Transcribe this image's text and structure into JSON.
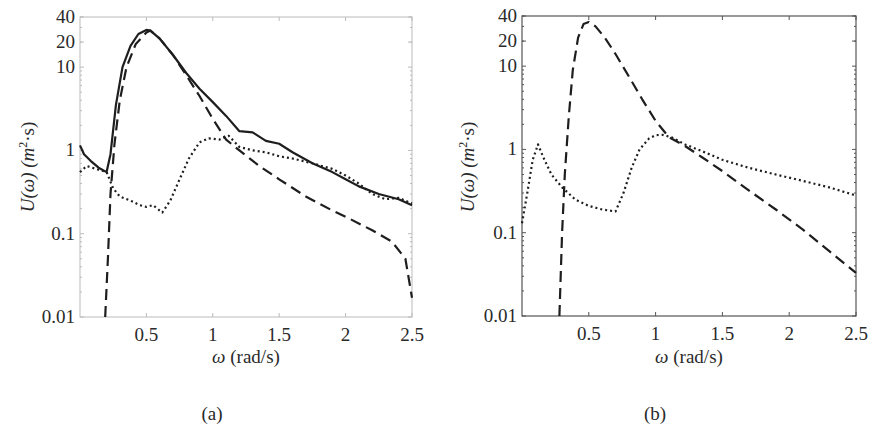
{
  "figure": {
    "panels": [
      {
        "id": "a",
        "caption": "(a)",
        "ylabel_main": "U(ω) (m",
        "ylabel_sup": "2",
        "ylabel_tail": "·s)",
        "xlabel_omega": "ω",
        "xlabel_unit": "(rad/s)",
        "y_tick_labels": [
          "40",
          "20",
          "10",
          "1",
          "0.1",
          "0.01"
        ],
        "x_tick_labels": [
          "0.5",
          "1",
          "1.5",
          "2",
          "2.5"
        ]
      },
      {
        "id": "b",
        "caption": "(b)",
        "ylabel_main": "U(ω) (m",
        "ylabel_sup": "2",
        "ylabel_tail": "·s)",
        "xlabel_omega": "ω",
        "xlabel_unit": "(rad/s)",
        "y_tick_labels": [
          "40",
          "20",
          "10",
          "1",
          "0.1",
          "0.01"
        ],
        "x_tick_labels": [
          "0.5",
          "1",
          "1.5",
          "2",
          "2.5"
        ]
      }
    ]
  },
  "chart_data": [
    {
      "type": "line",
      "panel": "(a)",
      "title": "",
      "xlabel": "ω (rad/s)",
      "ylabel": "U(ω) (m²·s)",
      "xlim": [
        0,
        2.5
      ],
      "ylim": [
        0.01,
        40
      ],
      "yscale": "log",
      "x_ticks": [
        0.5,
        1,
        1.5,
        2,
        2.5
      ],
      "y_ticks": [
        0.01,
        0.1,
        1,
        10,
        20,
        40
      ],
      "grid": false,
      "legend": "none",
      "series": [
        {
          "name": "solid",
          "style": "solid",
          "x": [
            0.0,
            0.03,
            0.08,
            0.14,
            0.2,
            0.23,
            0.27,
            0.32,
            0.38,
            0.44,
            0.5,
            0.53,
            0.6,
            0.7,
            0.8,
            0.9,
            1.0,
            1.1,
            1.2,
            1.3,
            1.4,
            1.5,
            1.6,
            1.75,
            1.9,
            2.0,
            2.1,
            2.25,
            2.4,
            2.5
          ],
          "values": [
            1.15,
            0.9,
            0.75,
            0.62,
            0.55,
            0.9,
            3.5,
            10,
            18,
            25,
            28,
            27.5,
            22,
            14,
            8.5,
            5.5,
            3.8,
            2.6,
            1.7,
            1.65,
            1.3,
            1.2,
            0.95,
            0.7,
            0.55,
            0.45,
            0.37,
            0.3,
            0.26,
            0.22
          ]
        },
        {
          "name": "dashed",
          "style": "dashed",
          "x": [
            0.19,
            0.21,
            0.23,
            0.26,
            0.3,
            0.35,
            0.42,
            0.5,
            0.53,
            0.6,
            0.7,
            0.8,
            0.9,
            1.0,
            1.1,
            1.2,
            1.35,
            1.5,
            1.7,
            1.9,
            2.0,
            2.2,
            2.35,
            2.45,
            2.5
          ],
          "values": [
            0.01,
            0.05,
            0.3,
            1.2,
            4,
            10,
            19,
            26,
            27.5,
            22,
            14,
            8,
            4.5,
            2.4,
            1.35,
            1.0,
            0.65,
            0.45,
            0.28,
            0.19,
            0.16,
            0.11,
            0.08,
            0.05,
            0.017
          ]
        },
        {
          "name": "dotted",
          "style": "dotted",
          "x": [
            0.0,
            0.05,
            0.12,
            0.2,
            0.25,
            0.3,
            0.38,
            0.45,
            0.5,
            0.55,
            0.62,
            0.68,
            0.75,
            0.82,
            0.9,
            0.97,
            1.05,
            1.12,
            1.2,
            1.3,
            1.4,
            1.5,
            1.6,
            1.75,
            1.9,
            2.0,
            2.1,
            2.2,
            2.3,
            2.4,
            2.5
          ],
          "values": [
            0.55,
            0.65,
            0.6,
            0.55,
            0.35,
            0.28,
            0.25,
            0.22,
            0.21,
            0.22,
            0.18,
            0.25,
            0.45,
            0.8,
            1.25,
            1.4,
            1.35,
            1.5,
            1.1,
            1.0,
            0.95,
            0.85,
            0.8,
            0.7,
            0.6,
            0.5,
            0.4,
            0.3,
            0.26,
            0.27,
            0.23
          ]
        }
      ]
    },
    {
      "type": "line",
      "panel": "(b)",
      "title": "",
      "xlabel": "ω (rad/s)",
      "ylabel": "U(ω) (m²·s)",
      "xlim": [
        0,
        2.5
      ],
      "ylim": [
        0.01,
        40
      ],
      "yscale": "log",
      "x_ticks": [
        0.5,
        1,
        1.5,
        2,
        2.5
      ],
      "y_ticks": [
        0.01,
        0.1,
        1,
        10,
        20,
        40
      ],
      "grid": false,
      "legend": "none",
      "series": [
        {
          "name": "dashed",
          "style": "dashed",
          "x": [
            0.28,
            0.3,
            0.32,
            0.35,
            0.38,
            0.42,
            0.46,
            0.5,
            0.55,
            0.62,
            0.7,
            0.8,
            0.9,
            1.0,
            1.1,
            1.22,
            1.35,
            1.5,
            1.7,
            1.9,
            2.1,
            2.3,
            2.5
          ],
          "values": [
            0.01,
            0.1,
            0.5,
            2.5,
            9,
            22,
            32,
            34,
            30,
            22,
            14,
            7.5,
            4,
            2.2,
            1.4,
            1.1,
            0.8,
            0.55,
            0.32,
            0.19,
            0.11,
            0.06,
            0.033
          ]
        },
        {
          "name": "dotted",
          "style": "dotted",
          "x": [
            0.0,
            0.04,
            0.08,
            0.12,
            0.16,
            0.22,
            0.3,
            0.4,
            0.5,
            0.6,
            0.7,
            0.76,
            0.82,
            0.88,
            0.95,
            1.0,
            1.05,
            1.12,
            1.22,
            1.35,
            1.5,
            1.7,
            1.9,
            2.1,
            2.3,
            2.5
          ],
          "values": [
            0.13,
            0.3,
            0.75,
            1.15,
            0.8,
            0.5,
            0.35,
            0.25,
            0.21,
            0.19,
            0.18,
            0.3,
            0.6,
            1.0,
            1.35,
            1.48,
            1.5,
            1.4,
            1.15,
            0.95,
            0.75,
            0.6,
            0.5,
            0.42,
            0.35,
            0.28
          ]
        }
      ]
    }
  ]
}
